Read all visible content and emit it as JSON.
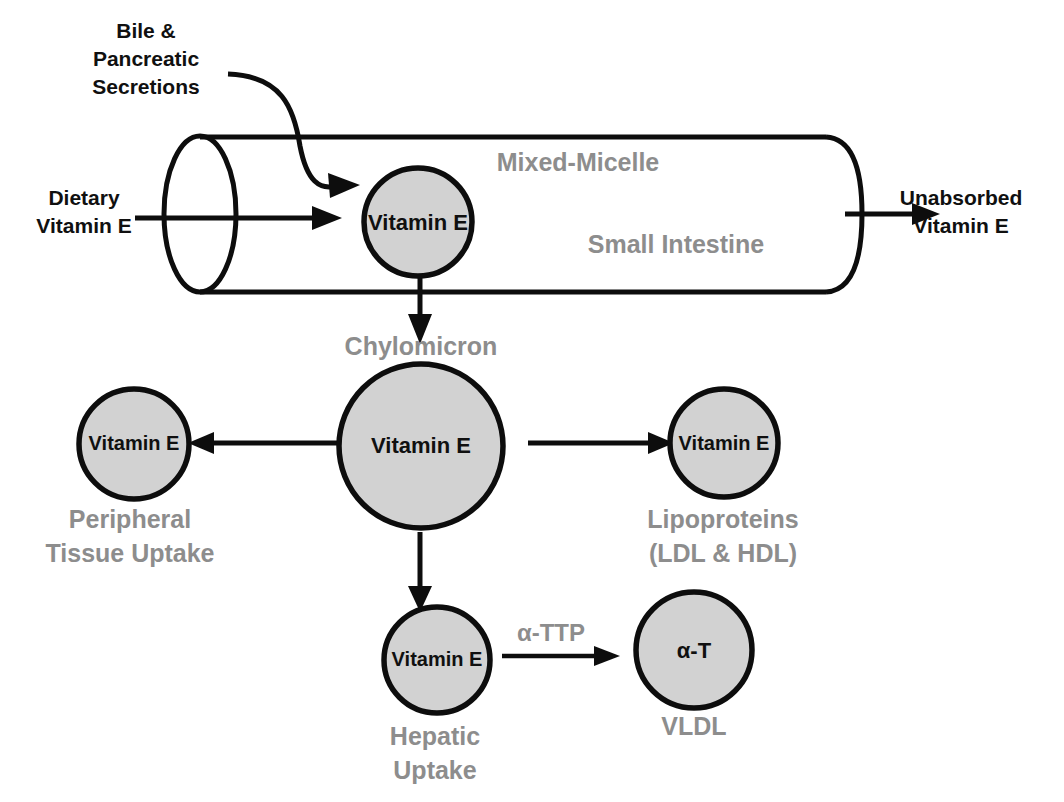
{
  "figure": {
    "background_color": "#ffffff",
    "black_text_color": "#101010",
    "gray_text_color": "#8d8d8d",
    "circle_fill_color": "#d2d2d2",
    "outline_color": "#0d0d0d"
  },
  "labels": {
    "bile_line1": "Bile &",
    "bile_line2": "Pancreatic",
    "bile_line3": "Secretions",
    "dietary_line1": "Dietary",
    "dietary_line2": "Vitamin E",
    "unabsorbed_line1": "Unabsorbed",
    "unabsorbed_line2": "Vitamin E",
    "mixed_micelle": "Mixed-Micelle",
    "small_intestine": "Small Intestine",
    "chylomicron": "Chylomicron",
    "peripheral_line1": "Peripheral",
    "peripheral_line2": "Tissue Uptake",
    "lipoproteins_line1": "Lipoproteins",
    "lipoproteins_line2": "(LDL & HDL)",
    "hepatic_line1": "Hepatic",
    "hepatic_line2": "Uptake",
    "vldl": "VLDL",
    "alpha_ttp": "α-TTP"
  },
  "circles": [
    {
      "id": "micelle-vitamin-e",
      "text": "Vitamin E",
      "cx": 418,
      "cy": 222,
      "r": 54,
      "font_size": 22
    },
    {
      "id": "chylomicron-vitamin-e",
      "text": "Vitamin E",
      "cx": 421,
      "cy": 446,
      "r": 82,
      "font_size": 22
    },
    {
      "id": "peripheral-vitamin-e",
      "text": "Vitamin E",
      "cx": 134,
      "cy": 444,
      "r": 55,
      "font_size": 20
    },
    {
      "id": "lipoprotein-vitamin-e",
      "text": "Vitamin E",
      "cx": 724,
      "cy": 443,
      "r": 54,
      "font_size": 20
    },
    {
      "id": "hepatic-vitamin-e",
      "text": "Vitamin E",
      "cx": 437,
      "cy": 660,
      "r": 53,
      "font_size": 20
    },
    {
      "id": "vldl-alpha-t",
      "text": "α-T",
      "cx": 694,
      "cy": 650,
      "r": 58,
      "font_size": 22
    }
  ],
  "tube": {
    "left_x": 200,
    "right_x": 862,
    "top_y": 137,
    "bottom_y": 292,
    "cap_rx": 36,
    "cap_ry": 78
  },
  "arrows": [
    {
      "id": "dietary-in",
      "from_x": 135,
      "from_y": 218,
      "to_x": 322,
      "to_y": 218,
      "direction": "right"
    },
    {
      "id": "unabsorbed-out",
      "from_x": 845,
      "from_y": 214,
      "to_x": 930,
      "to_y": 214,
      "direction": "right"
    },
    {
      "id": "bile-curve",
      "from_x": 228,
      "from_y": 74,
      "to_x": 352,
      "to_y": 186,
      "direction": "curved"
    },
    {
      "id": "micelle-to-chylomicron",
      "from_x": 420,
      "from_y": 278,
      "to_x": 420,
      "to_y": 328,
      "direction": "down"
    },
    {
      "id": "chylomicron-to-peripheral",
      "from_x": 342,
      "from_y": 443,
      "to_x": 200,
      "to_y": 443,
      "direction": "left"
    },
    {
      "id": "chylomicron-to-lipoprotein",
      "from_x": 528,
      "from_y": 443,
      "to_x": 660,
      "to_y": 443,
      "direction": "right"
    },
    {
      "id": "chylomicron-to-hepatic",
      "from_x": 420,
      "from_y": 532,
      "to_x": 420,
      "to_y": 602,
      "direction": "down"
    },
    {
      "id": "hepatic-to-vldl",
      "from_x": 502,
      "from_y": 655,
      "to_x": 612,
      "to_y": 655,
      "direction": "right"
    }
  ]
}
